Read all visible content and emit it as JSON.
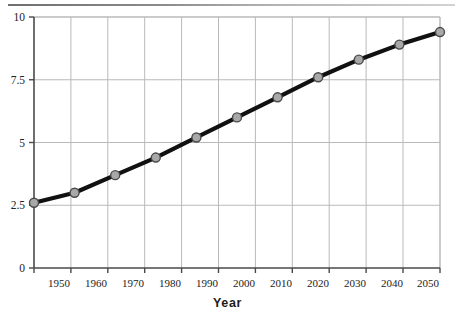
{
  "chart_data": {
    "type": "line",
    "title": "",
    "subtitle": "",
    "xlabel": "Year",
    "ylabel": "",
    "x": [
      1950,
      1960,
      1970,
      1980,
      1990,
      2000,
      2010,
      2020,
      2030,
      2040,
      2050
    ],
    "categories": [
      "1950",
      "1960",
      "1970",
      "1980",
      "1990",
      "2000",
      "2010",
      "2020",
      "2030",
      "2040",
      "2050"
    ],
    "values": [
      2.6,
      3.0,
      3.7,
      4.4,
      5.2,
      6.0,
      6.8,
      7.6,
      8.3,
      8.9,
      9.4
    ],
    "series": [
      {
        "name": "",
        "values": [
          2.6,
          3.0,
          3.7,
          4.4,
          5.2,
          6.0,
          6.8,
          7.6,
          8.3,
          8.9,
          9.4
        ]
      }
    ],
    "xlim": [
      1945,
      2055
    ],
    "ylim": [
      0,
      10
    ],
    "yticks": [
      0,
      2.5,
      5,
      7.5,
      10
    ],
    "ytick_labels": [
      "0",
      "2.5",
      "5",
      "7.5",
      "10"
    ],
    "xticks": [
      1950,
      1960,
      1970,
      1980,
      1990,
      2000,
      2010,
      2020,
      2030,
      2040,
      2050
    ],
    "xtick_labels": [
      "1950",
      "1960",
      "1970",
      "1980",
      "1990",
      "2000",
      "2010",
      "2020",
      "2030",
      "2040",
      "2050"
    ],
    "grid": true,
    "grid_axes": "both",
    "legend": false,
    "legend_position": "none",
    "annotations": [],
    "colors": {
      "line": "#111111",
      "marker_fill": "#a8a8a8",
      "marker_edge": "#4a4a4a",
      "grid": "#b9b9b9",
      "axis": "#3a3a3a",
      "background": "#ffffff",
      "text": "#232323"
    },
    "style": {
      "line_width": 4.2,
      "marker": "circle",
      "marker_size": 9
    }
  },
  "axis_labels": {
    "x_title": "Year"
  }
}
